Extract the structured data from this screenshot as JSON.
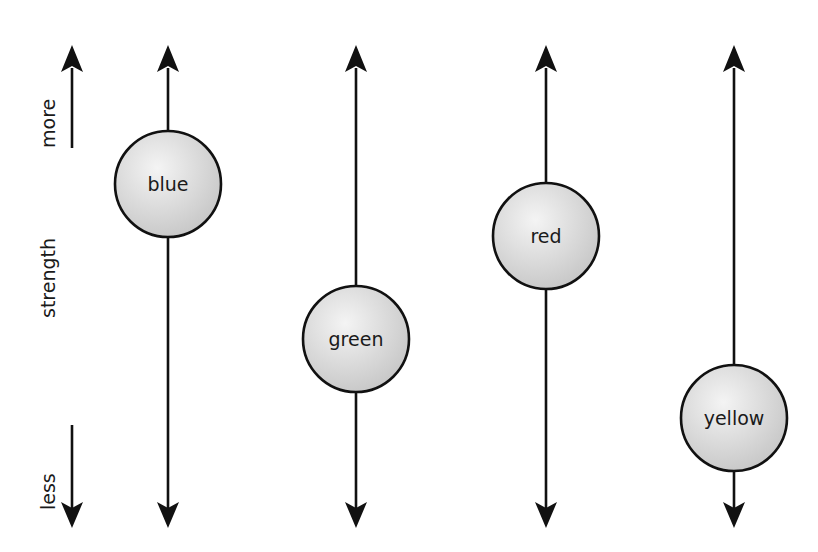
{
  "diagram": {
    "axis": {
      "title": "strength",
      "top_label": "more",
      "bottom_label": "less"
    },
    "columns": [
      {
        "label": "blue",
        "x": 168,
        "circle_cy": 184,
        "radius": 53
      },
      {
        "label": "green",
        "x": 356,
        "circle_cy": 339,
        "radius": 53
      },
      {
        "label": "red",
        "x": 546,
        "circle_cy": 236,
        "radius": 53
      },
      {
        "label": "yellow",
        "x": 734,
        "circle_cy": 418,
        "radius": 53
      }
    ],
    "colors": {
      "line": "#111111",
      "circle_fill_light": "#f2f2f2",
      "circle_fill_dark": "#c9c9c9",
      "background": "#ffffff"
    }
  }
}
